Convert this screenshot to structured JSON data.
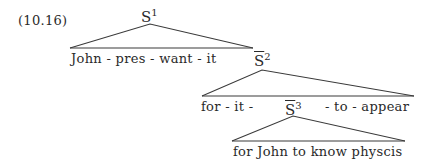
{
  "example_number": "(10.16)",
  "nodes": {
    "s1": {
      "label": "S",
      "sup": "1"
    },
    "s2": {
      "label": "S",
      "sup": "2",
      "barred": true
    },
    "s3": {
      "label": "S",
      "sup": "3",
      "barred": true
    }
  },
  "leaves": {
    "s1_yield": "John - pres - want - it",
    "s2_left": "for - it -",
    "s2_right": "- to - appear",
    "s3_yield": "for John to know physcis"
  },
  "colors": {
    "ink": "#2a2a2a",
    "background": "#ffffff"
  }
}
